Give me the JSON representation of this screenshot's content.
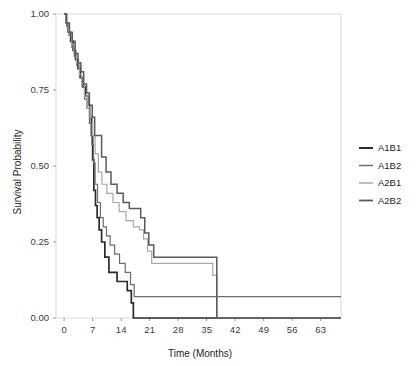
{
  "chart_data": {
    "type": "line",
    "title": "",
    "xlabel": "Time (Months)",
    "ylabel": "Survival Probability",
    "xlim": [
      -2,
      68
    ],
    "ylim": [
      0,
      1
    ],
    "xticks": [
      0,
      7,
      14,
      21,
      28,
      35,
      42,
      49,
      56,
      63
    ],
    "xtick_labels": [
      "0",
      "7",
      "14",
      "21",
      "28",
      "35",
      "42",
      "49",
      "56",
      "63"
    ],
    "yticks": [
      0.0,
      0.25,
      0.5,
      0.75,
      1.0
    ],
    "ytick_labels": [
      "0.00",
      "0.25",
      "0.50",
      "0.75",
      "1.00"
    ],
    "grid": false,
    "legend_position": "right",
    "step_type": "post",
    "series": [
      {
        "name": "A1B1",
        "color": "#2b2b2b",
        "width": 1.7,
        "x": [
          0,
          0.5,
          1,
          1.6,
          2.2,
          2.8,
          3.4,
          4.0,
          4.6,
          5.2,
          5.8,
          6.3,
          6.7,
          7.0,
          7.3,
          7.7,
          8.1,
          8.6,
          9.2,
          10.0,
          11.0,
          13.0,
          15.5,
          16.5,
          17.0,
          68
        ],
        "y": [
          1.0,
          0.97,
          0.94,
          0.91,
          0.88,
          0.85,
          0.82,
          0.79,
          0.76,
          0.73,
          0.7,
          0.66,
          0.6,
          0.52,
          0.42,
          0.37,
          0.33,
          0.29,
          0.25,
          0.2,
          0.15,
          0.12,
          0.09,
          0.05,
          0.0,
          0.0
        ]
      },
      {
        "name": "A1B2",
        "color": "#6d6d6d",
        "width": 1.2,
        "x": [
          0,
          0.6,
          1.2,
          1.9,
          2.5,
          3.1,
          3.8,
          4.4,
          5.0,
          5.6,
          6.2,
          6.8,
          7.2,
          7.6,
          8.2,
          8.9,
          9.6,
          10.4,
          11.3,
          12.4,
          13.6,
          15.0,
          16.3,
          17.2,
          37.5,
          68
        ],
        "y": [
          1.0,
          0.96,
          0.93,
          0.89,
          0.86,
          0.83,
          0.79,
          0.76,
          0.72,
          0.69,
          0.64,
          0.57,
          0.51,
          0.44,
          0.38,
          0.33,
          0.3,
          0.27,
          0.24,
          0.21,
          0.18,
          0.15,
          0.11,
          0.07,
          0.07,
          0.07
        ]
      },
      {
        "name": "A2B1",
        "color": "#a8a8a8",
        "width": 1.2,
        "x": [
          0,
          0.5,
          1.1,
          1.8,
          2.4,
          3.0,
          3.7,
          4.3,
          5.0,
          5.7,
          6.4,
          7.0,
          7.6,
          8.4,
          9.3,
          10.5,
          12.0,
          13.5,
          15.2,
          17.0,
          18.5,
          19.5,
          20.5,
          21.5,
          35.5,
          36.5,
          37.5,
          68
        ],
        "y": [
          1.0,
          0.97,
          0.94,
          0.9,
          0.87,
          0.84,
          0.8,
          0.77,
          0.73,
          0.7,
          0.66,
          0.6,
          0.54,
          0.48,
          0.44,
          0.41,
          0.38,
          0.35,
          0.32,
          0.3,
          0.29,
          0.26,
          0.22,
          0.18,
          0.18,
          0.14,
          0.0,
          0.0
        ]
      },
      {
        "name": "A2B2",
        "color": "#5a5a5a",
        "width": 1.5,
        "x": [
          0,
          0.6,
          1.3,
          2.0,
          2.7,
          3.4,
          4.1,
          4.8,
          5.5,
          6.2,
          6.9,
          7.5,
          8.3,
          9.2,
          10.3,
          11.5,
          13.0,
          14.5,
          16.0,
          17.5,
          18.8,
          19.8,
          20.8,
          22.0,
          36.5,
          37.5,
          68
        ],
        "y": [
          1.0,
          0.97,
          0.94,
          0.91,
          0.87,
          0.84,
          0.81,
          0.77,
          0.74,
          0.7,
          0.66,
          0.6,
          0.6,
          0.53,
          0.48,
          0.44,
          0.41,
          0.38,
          0.36,
          0.36,
          0.33,
          0.28,
          0.24,
          0.2,
          0.2,
          0.0,
          0.0
        ]
      }
    ]
  },
  "legend": {
    "entries": [
      {
        "label": "A1B1"
      },
      {
        "label": "A1B2"
      },
      {
        "label": "A2B1"
      },
      {
        "label": "A2B2"
      }
    ]
  }
}
